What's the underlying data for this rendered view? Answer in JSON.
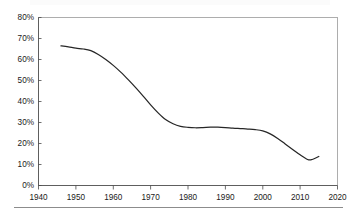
{
  "chart_data": {
    "type": "line",
    "title": "",
    "xlabel": "",
    "ylabel": "",
    "xlim": [
      1940,
      2020
    ],
    "ylim": [
      0,
      80
    ],
    "grid": false,
    "legend": null,
    "x_ticks": [
      "1940",
      "1950",
      "1960",
      "1970",
      "1980",
      "1990",
      "2000",
      "2010",
      "2020"
    ],
    "x_tick_values": [
      1940,
      1950,
      1960,
      1970,
      1980,
      1990,
      2000,
      2010,
      2020
    ],
    "y_ticks": [
      "0%",
      "10%",
      "20%",
      "30%",
      "40%",
      "50%",
      "60%",
      "70%",
      "80%"
    ],
    "y_tick_values": [
      0,
      10,
      20,
      30,
      40,
      50,
      60,
      70,
      80
    ],
    "line_color": "#262626",
    "border_color": "#9a9a9a",
    "series": [
      {
        "name": "series-1",
        "x": [
          1946,
          1948,
          1950,
          1952,
          1954,
          1956,
          1958,
          1960,
          1962,
          1964,
          1966,
          1968,
          1970,
          1972,
          1974,
          1976,
          1978,
          1980,
          1982,
          1984,
          1986,
          1988,
          1990,
          1992,
          1994,
          1996,
          1998,
          2000,
          2002,
          2004,
          2006,
          2008,
          2010,
          2012,
          2013,
          2015
        ],
        "values": [
          66.5,
          66.0,
          65.4,
          65.0,
          64.2,
          62.4,
          60.0,
          57.2,
          54.0,
          50.4,
          46.6,
          42.6,
          38.4,
          34.6,
          31.4,
          29.4,
          28.2,
          27.7,
          27.5,
          27.6,
          27.8,
          27.8,
          27.6,
          27.3,
          27.1,
          26.9,
          26.6,
          26.0,
          24.6,
          22.4,
          19.8,
          17.2,
          14.6,
          12.4,
          12.3,
          13.8
        ]
      }
    ]
  },
  "axes": {
    "y_axis_name": "percent-axis",
    "x_axis_name": "year-axis"
  }
}
